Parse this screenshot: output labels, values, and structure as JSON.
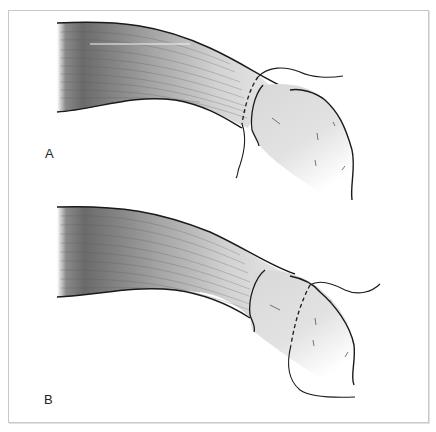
{
  "figure": {
    "panels": [
      {
        "id": "A",
        "label": "A",
        "description": "Tendon end inserted into tissue sheath with suture line proximal to junction"
      },
      {
        "id": "B",
        "label": "B",
        "description": "Tendon end inserted into tissue with suture line distal to junction"
      }
    ],
    "colors": {
      "frame_border": "#c8c8c8",
      "outline": "#1a1a1a",
      "tendon_dark": "#6e6e6e",
      "tendon_light": "#e4e4e4",
      "tissue_fill": "#dcdcdc",
      "background": "#ffffff"
    }
  }
}
